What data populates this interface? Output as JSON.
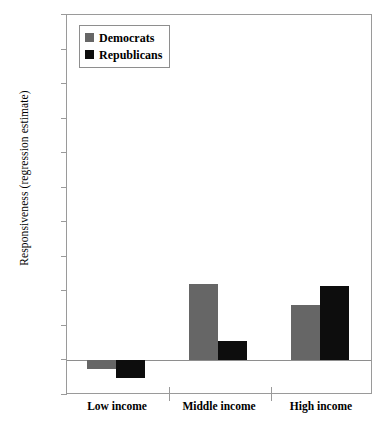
{
  "chart_data": {
    "type": "bar",
    "title": "",
    "xlabel": "",
    "ylabel": "Responsiveness (regression estimate)",
    "categories": [
      "Low income",
      "Middle income",
      "High income"
    ],
    "series": [
      {
        "name": "Democrats",
        "color": "#666666",
        "values": [
          -0.5,
          4.4,
          3.2
        ]
      },
      {
        "name": "Republicans",
        "color": "#0d0d0d",
        "values": [
          -1.0,
          1.1,
          4.3
        ]
      }
    ],
    "ylim": [
      -2,
      20
    ],
    "ytick_labels": [
      "20",
      "18",
      "16",
      "14",
      "12",
      "10",
      "8",
      "6",
      "4",
      "2",
      "0",
      "-2"
    ],
    "ytick_values": [
      20,
      18,
      16,
      14,
      12,
      10,
      8,
      6,
      4,
      2,
      0,
      -2
    ],
    "grid": false,
    "legend_position": "top-left",
    "legend_entries": [
      "Democrats",
      "Republicans"
    ]
  },
  "axis": {
    "y_title": "Responsiveness (regression estimate)"
  },
  "legend": {
    "items": [
      {
        "label": "Democrats"
      },
      {
        "label": "Republicans"
      }
    ]
  }
}
